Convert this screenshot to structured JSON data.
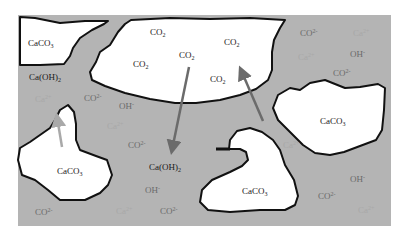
{
  "diagram": {
    "title": "",
    "colors": {
      "background": "#ffffff",
      "solution": "#b4b4b4",
      "particle_fill": "#ffffff",
      "outline": "#111111",
      "arrow_dark": "#6b6b6b",
      "arrow_light": "#a9a9a9"
    },
    "regions": [
      {
        "id": "caco3-top-left",
        "label_main": "CaCO",
        "label_sub": "3"
      },
      {
        "id": "co2-pore",
        "label_main": "CO",
        "label_sub": "2"
      },
      {
        "id": "caco3-right",
        "label_main": "CaCO",
        "label_sub": "3"
      },
      {
        "id": "caco3-left-bottom",
        "label_main": "CaCO",
        "label_sub": "3"
      },
      {
        "id": "caco3-center-bottom",
        "label_main": "CaCO",
        "label_sub": "3"
      }
    ],
    "co2_labels": [
      {
        "main": "CO",
        "sub": "2"
      },
      {
        "main": "CO",
        "sub": "2"
      },
      {
        "main": "CO",
        "sub": "2"
      },
      {
        "main": "CO",
        "sub": "2"
      },
      {
        "main": "CO",
        "sub": "2"
      },
      {
        "main": "CO",
        "sub": "2"
      }
    ],
    "species": {
      "caoh2_left": {
        "main": "Ca(OH)",
        "sub": "2"
      },
      "caoh2_center": {
        "main": "Ca(OH)",
        "sub": "2"
      },
      "carbonate": {
        "main": "CO",
        "sub": "3",
        "sup": "2-"
      },
      "hydroxide": {
        "main": "OH",
        "sup": "-"
      },
      "calcium": {
        "main": "Ca",
        "sup": "2+"
      }
    },
    "arrows": [
      {
        "id": "co2-diffusion-down",
        "from": "CO2 pore",
        "to": "Ca(OH)2",
        "tone": "dark"
      },
      {
        "id": "co2-diffusion-up",
        "from": "solution",
        "to": "CO2 pore",
        "tone": "dark"
      },
      {
        "id": "ca-release-up",
        "from": "CaCO3",
        "to": "solution",
        "tone": "light"
      }
    ]
  }
}
